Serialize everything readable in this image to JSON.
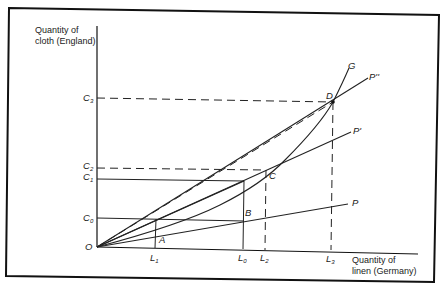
{
  "diagram": {
    "y_axis_label_line1": "Quantity of",
    "y_axis_label_line2": "cloth (England)",
    "x_axis_label_line1": "Quantity of",
    "x_axis_label_line2": "linen (Germany)",
    "origin": "O",
    "y_ticks": [
      {
        "base": "C",
        "sub": "3"
      },
      {
        "base": "C",
        "sub": "2"
      },
      {
        "base": "C",
        "sub": "1"
      },
      {
        "base": "C",
        "sub": "0"
      }
    ],
    "x_ticks": [
      {
        "base": "L",
        "sub": "1"
      },
      {
        "base": "L",
        "sub": "0"
      },
      {
        "base": "L",
        "sub": "2"
      },
      {
        "base": "L",
        "sub": "3"
      }
    ],
    "points": [
      "A",
      "B",
      "C",
      "D"
    ],
    "curves": {
      "offer_curve": "G",
      "price_line_p": "P",
      "price_line_p1": "P'",
      "price_line_p2": "P''"
    }
  }
}
